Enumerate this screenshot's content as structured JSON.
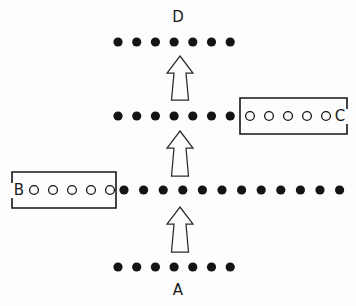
{
  "figure": {
    "title": "",
    "background_color": "#fdfdfd",
    "ink_color": "#141414",
    "width": 356,
    "height": 306
  },
  "rows": [
    {
      "id": "row-d",
      "label": "D",
      "label_position": "above",
      "label_x": 178,
      "label_y": 17,
      "y": 42,
      "filled_dot_count": 7,
      "filled_dot_start_x": 118,
      "filled_dot_spacing": 18.7,
      "filled_dot_radius": 4.6,
      "open_circle_count": 0,
      "bracket": null
    },
    {
      "id": "row-c",
      "label": "C",
      "label_position": "right-inline",
      "label_x": 340,
      "label_y": 116,
      "y": 116,
      "filled_dot_count": 7,
      "filled_dot_start_x": 118,
      "filled_dot_spacing": 18.7,
      "filled_dot_radius": 4.6,
      "open_circle_count": 5,
      "open_circle_start_x": 250,
      "open_circle_spacing": 19.0,
      "open_circle_radius": 4.4,
      "bracket": {
        "side": "open-right",
        "x_left": 240,
        "x_right": 347,
        "y_top": 98,
        "y_bottom": 134,
        "gap_top": 109,
        "gap_bottom": 124
      }
    },
    {
      "id": "row-b",
      "label": "B",
      "label_position": "left-inline",
      "label_x": 19,
      "label_y": 190,
      "y": 190,
      "filled_dot_count": 12,
      "filled_dot_start_x": 124,
      "filled_dot_spacing": 19.6,
      "filled_dot_radius": 4.6,
      "open_circle_count": 5,
      "open_circle_start_x": 34,
      "open_circle_spacing": 19.0,
      "open_circle_radius": 4.4,
      "bracket": {
        "side": "open-left",
        "x_left": 12,
        "x_right": 116,
        "y_top": 172,
        "y_bottom": 208,
        "gap_top": 183,
        "gap_bottom": 198
      }
    },
    {
      "id": "row-a",
      "label": "A",
      "label_position": "below",
      "label_x": 178,
      "label_y": 290,
      "y": 267,
      "filled_dot_count": 7,
      "filled_dot_start_x": 118,
      "filled_dot_spacing": 18.7,
      "filled_dot_radius": 4.6,
      "open_circle_count": 0,
      "bracket": null
    }
  ],
  "arrows": [
    {
      "id": "arrow-a-to-b",
      "direction": "up",
      "from_row": "A",
      "to_row": "B",
      "center_x": 180,
      "tip_y": 207,
      "tail_y": 252,
      "head_half_width": 13,
      "head_height": 17,
      "shaft_half_width_top": 6,
      "shaft_half_width_bottom": 8.5
    },
    {
      "id": "arrow-b-to-c",
      "direction": "up",
      "from_row": "B",
      "to_row": "C",
      "center_x": 180,
      "tip_y": 131,
      "tail_y": 176,
      "head_half_width": 13,
      "head_height": 17,
      "shaft_half_width_top": 6,
      "shaft_half_width_bottom": 8.5
    },
    {
      "id": "arrow-c-to-d",
      "direction": "up",
      "from_row": "C",
      "to_row": "D",
      "center_x": 180,
      "tip_y": 56,
      "tail_y": 100,
      "head_half_width": 13,
      "head_height": 17,
      "shaft_half_width_top": 6,
      "shaft_half_width_bottom": 8.5
    }
  ]
}
